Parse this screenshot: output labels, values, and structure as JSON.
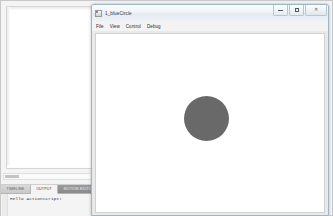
{
  "ide": {
    "name": "Adobe Flash authoring workspace",
    "document_area": {
      "background": "#ffffff"
    },
    "scrollbars": {
      "vertical": "vertical-scrollbar",
      "horizontal": "horizontal-scrollbar"
    },
    "panel": {
      "tabs": [
        {
          "label": "TIMELINE",
          "state": "inactive"
        },
        {
          "label": "OUTPUT",
          "state": "active"
        },
        {
          "label": "MOTION EDITOR",
          "state": "dark"
        }
      ],
      "output": {
        "text": "Hello ActionScript!"
      }
    }
  },
  "player": {
    "title": "1_blueCircle",
    "icon": "flash-player-icon",
    "window_buttons": [
      {
        "name": "minimize-button",
        "glyph": "minimize"
      },
      {
        "name": "maximize-button",
        "glyph": "maximize"
      },
      {
        "name": "close-button",
        "glyph": "✕"
      }
    ],
    "menu": [
      {
        "label": "File"
      },
      {
        "label": "View"
      },
      {
        "label": "Control"
      },
      {
        "label": "Debug"
      }
    ],
    "stage": {
      "background": "#ffffff",
      "shape": {
        "type": "circle",
        "name": "gray-circle",
        "color": "#696969",
        "diameter_px": 45,
        "center_x_px": 110,
        "center_y_px": 84
      }
    }
  }
}
